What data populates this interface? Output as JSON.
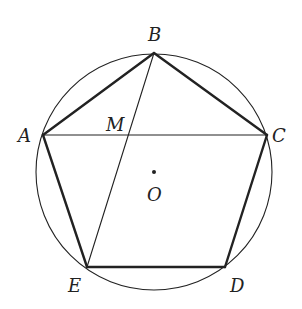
{
  "figure": {
    "type": "inscribed-regular-pentagon",
    "colors": {
      "stroke": "#222222",
      "background": "#ffffff"
    },
    "circle": {
      "center": "O",
      "cx": 154,
      "cy": 172,
      "r": 118
    },
    "points": {
      "A": {
        "x": 43,
        "y": 135,
        "label": "A",
        "lx": 18,
        "ly": 142
      },
      "B": {
        "x": 154,
        "y": 53,
        "label": "B",
        "lx": 148,
        "ly": 41
      },
      "C": {
        "x": 267,
        "y": 135,
        "label": "C",
        "lx": 272,
        "ly": 142
      },
      "D": {
        "x": 225,
        "y": 267,
        "label": "D",
        "lx": 230,
        "ly": 292
      },
      "E": {
        "x": 87,
        "y": 267,
        "label": "E",
        "lx": 68,
        "ly": 292
      },
      "M": {
        "x": 128,
        "y": 135,
        "label": "M",
        "lx": 106,
        "ly": 131
      },
      "O": {
        "x": 154,
        "y": 172,
        "label": "O",
        "lx": 147,
        "ly": 201
      }
    },
    "pentagon_sides": [
      [
        "A",
        "B"
      ],
      [
        "B",
        "C"
      ],
      [
        "C",
        "D"
      ],
      [
        "D",
        "E"
      ],
      [
        "E",
        "A"
      ]
    ],
    "chords": [
      [
        "A",
        "C"
      ],
      [
        "B",
        "E"
      ]
    ],
    "labels": [
      "A",
      "B",
      "C",
      "D",
      "E",
      "M",
      "O"
    ]
  }
}
